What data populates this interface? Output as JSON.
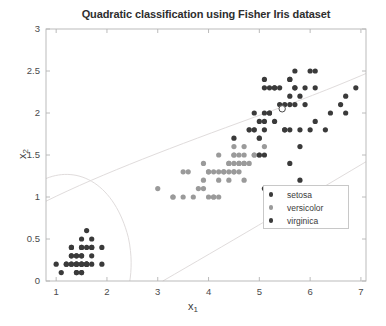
{
  "chart_data": {
    "type": "scatter",
    "title": "Quadratic classification using Fisher Iris dataset",
    "xlabel": "x",
    "xlabel_sub": "1",
    "ylabel": "x",
    "ylabel_sub": "2",
    "xlim": [
      0.8,
      7.1
    ],
    "ylim": [
      0,
      3
    ],
    "xticks": [
      1,
      2,
      3,
      4,
      5,
      6,
      7
    ],
    "yticks": [
      0,
      0.5,
      1,
      1.5,
      2,
      2.5,
      3
    ],
    "xtick_labels": [
      "1",
      "2",
      "3",
      "4",
      "5",
      "6",
      "7"
    ],
    "ytick_labels": [
      "0",
      "0.5",
      "1",
      "1.5",
      "2",
      "2.5",
      "3"
    ],
    "grid": false,
    "legend_position": "center-right",
    "colors": {
      "setosa": "#3a3a3a",
      "versicolor": "#9a9a9a",
      "virginica": "#3a3a3a",
      "boundary": "#e0dcdc",
      "axis": "#b4b4b4",
      "text": "#3b3b3b"
    },
    "series": [
      {
        "name": "setosa",
        "color": "#3a3a3a",
        "marker": "filled-circle",
        "points": [
          [
            1.0,
            0.2
          ],
          [
            1.1,
            0.1
          ],
          [
            1.2,
            0.2
          ],
          [
            1.3,
            0.2
          ],
          [
            1.3,
            0.3
          ],
          [
            1.3,
            0.4
          ],
          [
            1.4,
            0.1
          ],
          [
            1.4,
            0.2
          ],
          [
            1.4,
            0.3
          ],
          [
            1.5,
            0.1
          ],
          [
            1.5,
            0.2
          ],
          [
            1.5,
            0.3
          ],
          [
            1.5,
            0.4
          ],
          [
            1.5,
            0.5
          ],
          [
            1.6,
            0.2
          ],
          [
            1.6,
            0.4
          ],
          [
            1.6,
            0.6
          ],
          [
            1.7,
            0.2
          ],
          [
            1.7,
            0.3
          ],
          [
            1.7,
            0.4
          ],
          [
            1.7,
            0.5
          ],
          [
            1.9,
            0.2
          ],
          [
            1.9,
            0.4
          ],
          [
            1.2,
            0.2
          ],
          [
            1.4,
            0.2
          ],
          [
            1.5,
            0.2
          ],
          [
            1.6,
            0.2
          ],
          [
            1.3,
            0.2
          ],
          [
            1.4,
            0.1
          ],
          [
            1.5,
            0.1
          ],
          [
            1.6,
            0.2
          ],
          [
            1.3,
            0.3
          ],
          [
            1.4,
            0.3
          ],
          [
            1.5,
            0.3
          ],
          [
            1.3,
            0.4
          ],
          [
            1.5,
            0.4
          ],
          [
            1.7,
            0.4
          ],
          [
            1.5,
            0.2
          ],
          [
            1.4,
            0.2
          ],
          [
            1.6,
            0.2
          ]
        ]
      },
      {
        "name": "versicolor",
        "color": "#9a9a9a",
        "marker": "filled-circle",
        "points": [
          [
            3.0,
            1.1
          ],
          [
            3.3,
            1.0
          ],
          [
            3.5,
            1.0
          ],
          [
            3.5,
            1.3
          ],
          [
            3.6,
            1.3
          ],
          [
            3.7,
            1.0
          ],
          [
            3.9,
            1.1
          ],
          [
            3.9,
            1.2
          ],
          [
            3.9,
            1.4
          ],
          [
            4.0,
            1.0
          ],
          [
            4.0,
            1.3
          ],
          [
            4.1,
            1.0
          ],
          [
            4.1,
            1.3
          ],
          [
            4.2,
            1.2
          ],
          [
            4.2,
            1.3
          ],
          [
            4.2,
            1.5
          ],
          [
            4.3,
            1.3
          ],
          [
            4.4,
            1.2
          ],
          [
            4.4,
            1.3
          ],
          [
            4.4,
            1.4
          ],
          [
            4.5,
            1.3
          ],
          [
            4.5,
            1.5
          ],
          [
            4.5,
            1.6
          ],
          [
            4.6,
            1.3
          ],
          [
            4.6,
            1.4
          ],
          [
            4.6,
            1.5
          ],
          [
            4.7,
            1.2
          ],
          [
            4.7,
            1.4
          ],
          [
            4.7,
            1.6
          ],
          [
            4.8,
            1.4
          ],
          [
            4.8,
            1.8
          ],
          [
            4.9,
            1.5
          ],
          [
            4.9,
            1.8
          ],
          [
            5.0,
            1.7
          ],
          [
            5.1,
            1.6
          ],
          [
            3.3,
            1.0
          ],
          [
            3.8,
            1.1
          ],
          [
            4.0,
            1.3
          ],
          [
            4.5,
            1.5
          ],
          [
            4.7,
            1.5
          ],
          [
            4.4,
            1.4
          ],
          [
            4.6,
            1.4
          ],
          [
            4.9,
            1.5
          ],
          [
            5.0,
            1.5
          ],
          [
            4.1,
            1.0
          ],
          [
            4.2,
            1.0
          ],
          [
            4.3,
            1.3
          ],
          [
            4.5,
            1.4
          ],
          [
            4.5,
            1.3
          ],
          [
            4.7,
            1.4
          ]
        ]
      },
      {
        "name": "virginica",
        "color": "#3a3a3a",
        "marker": "filled-circle",
        "points": [
          [
            4.5,
            1.7
          ],
          [
            4.8,
            1.8
          ],
          [
            4.9,
            2.0
          ],
          [
            5.0,
            1.5
          ],
          [
            5.0,
            1.7
          ],
          [
            5.0,
            1.9
          ],
          [
            5.1,
            1.5
          ],
          [
            5.1,
            1.8
          ],
          [
            5.1,
            1.9
          ],
          [
            5.1,
            2.0
          ],
          [
            5.1,
            2.3
          ],
          [
            5.2,
            2.0
          ],
          [
            5.2,
            2.3
          ],
          [
            5.3,
            1.9
          ],
          [
            5.3,
            2.3
          ],
          [
            5.4,
            2.1
          ],
          [
            5.4,
            2.3
          ],
          [
            5.5,
            1.8
          ],
          [
            5.5,
            2.1
          ],
          [
            5.6,
            1.4
          ],
          [
            5.6,
            1.8
          ],
          [
            5.6,
            2.1
          ],
          [
            5.6,
            2.2
          ],
          [
            5.6,
            2.4
          ],
          [
            5.7,
            2.1
          ],
          [
            5.7,
            2.3
          ],
          [
            5.7,
            2.5
          ],
          [
            5.8,
            1.6
          ],
          [
            5.8,
            1.8
          ],
          [
            5.8,
            2.2
          ],
          [
            5.9,
            2.1
          ],
          [
            5.9,
            2.3
          ],
          [
            6.0,
            1.8
          ],
          [
            6.0,
            2.5
          ],
          [
            6.1,
            1.9
          ],
          [
            6.1,
            2.3
          ],
          [
            6.1,
            2.5
          ],
          [
            6.3,
            1.8
          ],
          [
            6.4,
            2.0
          ],
          [
            6.6,
            2.1
          ],
          [
            6.7,
            2.0
          ],
          [
            6.7,
            2.2
          ],
          [
            6.9,
            2.3
          ],
          [
            5.1,
            2.4
          ],
          [
            5.2,
            2.0
          ],
          [
            5.5,
            1.8
          ],
          [
            5.3,
            2.3
          ],
          [
            4.9,
            1.8
          ],
          [
            5.6,
            2.4
          ],
          [
            5.7,
            2.3
          ],
          [
            5.8,
            1.2
          ],
          [
            5.1,
            1.1
          ]
        ]
      }
    ],
    "highlight_point": {
      "x": 5.45,
      "y": 2.05,
      "marker": "open-circle",
      "color": "#4a4a4a"
    },
    "decision_boundaries": [
      {
        "name": "setosa-versicolor-boundary",
        "description": "ellipse-like quadratic curve separating setosa region"
      },
      {
        "name": "versicolor-virginica-boundary",
        "description": "quadratic curve separating versicolor and virginica"
      }
    ],
    "legend": [
      {
        "label": "setosa",
        "color": "#3a3a3a"
      },
      {
        "label": "versicolor",
        "color": "#9a9a9a"
      },
      {
        "label": "virginica",
        "color": "#3a3a3a"
      }
    ]
  }
}
